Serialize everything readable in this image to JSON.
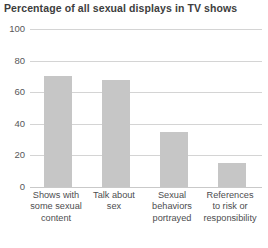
{
  "chart_data": {
    "type": "bar",
    "title": "Percentage of all sexual displays in TV shows",
    "xlabel": "",
    "ylabel": "",
    "ylim": [
      0,
      100
    ],
    "yticks": [
      0,
      20,
      40,
      60,
      80,
      100
    ],
    "ytick_labels": [
      "0",
      "20",
      "40",
      "60",
      "80",
      "100"
    ],
    "grid": true,
    "legend": "none",
    "bar_color": "#c6c6c6",
    "categories": [
      "Shows with some sexual content",
      "Talk about sex",
      "Sexual behaviors portrayed",
      "References to risk or responsibility"
    ],
    "category_lines": [
      [
        "Shows with",
        "some sexual",
        "content"
      ],
      [
        "Talk about",
        "sex"
      ],
      [
        "Sexual",
        "behaviors",
        "portrayed"
      ],
      [
        "References",
        "to risk or",
        "responsibility"
      ]
    ],
    "values": [
      70,
      68,
      35,
      15
    ]
  }
}
